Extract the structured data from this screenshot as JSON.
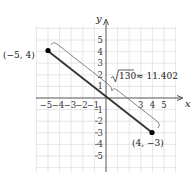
{
  "diagram": {
    "type": "coordinate-plane-distance",
    "axes": {
      "x_label": "x",
      "y_label": "y",
      "range": [
        -6,
        6
      ]
    },
    "x_ticks_negative": [
      "−5",
      "−4",
      "−3",
      "−2",
      "−1"
    ],
    "x_ticks_positive": [
      "3",
      "4",
      "5"
    ],
    "y_ticks_positive": [
      "5",
      "4",
      "3",
      "2",
      "1"
    ],
    "y_ticks_negative": [
      "1",
      "2",
      "3",
      "4",
      "5"
    ],
    "points": [
      {
        "label": "(−5, 4)",
        "x": -5,
        "y": 4
      },
      {
        "label": "(4, −3)",
        "x": 4,
        "y": -3
      }
    ],
    "distance_label": "√130 ≈ 11.402",
    "distance_radicand": "130",
    "distance_approx": "≈ 11.402",
    "colors": {
      "segment": "#333333",
      "grid": "#dddddd",
      "axis": "#555555",
      "point": "#000000"
    }
  }
}
